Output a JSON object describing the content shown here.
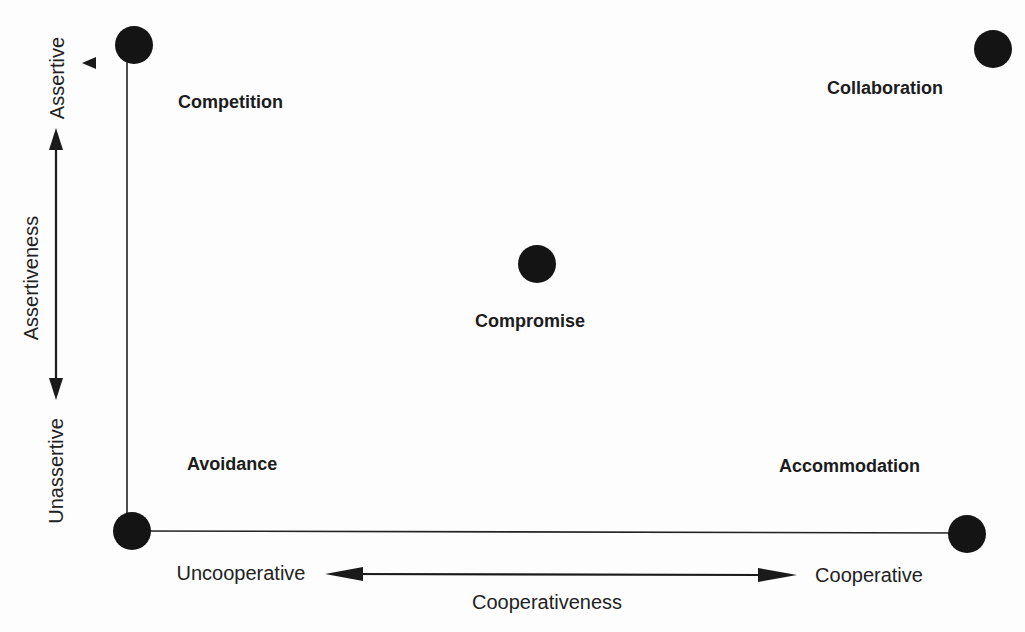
{
  "diagram": {
    "type": "conflict-handling-modes-grid",
    "modes": [
      {
        "id": "competition",
        "label": "Competition",
        "position": "top-left"
      },
      {
        "id": "collaboration",
        "label": "Collaboration",
        "position": "top-right"
      },
      {
        "id": "compromise",
        "label": "Compromise",
        "position": "center"
      },
      {
        "id": "avoidance",
        "label": "Avoidance",
        "position": "bottom-left"
      },
      {
        "id": "accommodation",
        "label": "Accommodation",
        "position": "bottom-right"
      }
    ],
    "vertical_axis": {
      "title": "Assertiveness",
      "high_label": "Assertive",
      "low_label": "Unassertive"
    },
    "horizontal_axis": {
      "title": "Cooperativeness",
      "low_label": "Uncooperative",
      "high_label": "Cooperative"
    },
    "colors": {
      "dot": "#141414",
      "line": "#222222",
      "background": "#fdfdfd"
    }
  }
}
